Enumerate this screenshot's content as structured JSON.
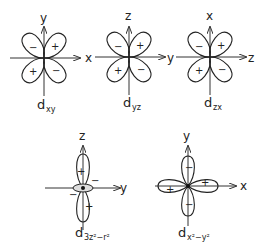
{
  "orbitals": [
    {
      "id": "dxy",
      "name_main": "d",
      "name_sub": "xy",
      "h_axis": "x",
      "v_axis": "y",
      "signs": [
        "−",
        "+",
        "+",
        "−"
      ]
    },
    {
      "id": "dyz",
      "name_main": "d",
      "name_sub": "yz",
      "h_axis": "y",
      "v_axis": "z",
      "signs": [
        "−",
        "+",
        "+",
        "−"
      ]
    },
    {
      "id": "dzx",
      "name_main": "d",
      "name_sub": "zx",
      "h_axis": "z",
      "v_axis": "x",
      "signs": [
        "−",
        "+",
        "+",
        "−"
      ]
    },
    {
      "id": "dz2",
      "name_main": "d",
      "name_sub": "3z²−r²",
      "h_axis": "y",
      "v_axis": "z",
      "signs": [
        "+",
        "+",
        "−",
        "−"
      ]
    },
    {
      "id": "dx2y2",
      "name_main": "d",
      "name_sub": "x²−y²",
      "h_axis": "x",
      "v_axis": "y",
      "signs": [
        "−",
        "−",
        "+",
        "+"
      ]
    }
  ]
}
